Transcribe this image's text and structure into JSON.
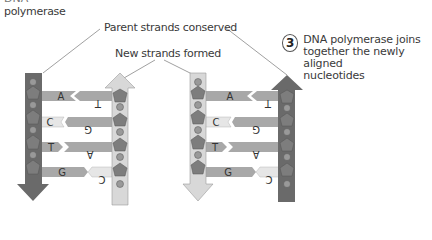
{
  "top_label": {
    "cut_line": "DNA",
    "text": "polymerase"
  },
  "labels": {
    "parent": "Parent strands conserved",
    "new": "New strands formed"
  },
  "step": {
    "number": "3",
    "line1": "DNA polymerase joins",
    "line2": "together the newly aligned",
    "line3": "nucleotides"
  },
  "colors": {
    "parent_strand": "#6a6a6a",
    "new_strand": "#d6d6d6",
    "base_bar": "#a8a8a8",
    "base_light": "#e6e6e6",
    "sugar": "#7a7a7a",
    "phosphate": "#9a9a9a"
  },
  "left_helix": {
    "parent_bases": [
      "A",
      "C",
      "T",
      "G"
    ],
    "new_bases": [
      "T",
      "G",
      "A",
      "C"
    ]
  },
  "right_helix": {
    "new_bases": [
      "A",
      "C",
      "T",
      "G"
    ],
    "parent_bases": [
      "T",
      "G",
      "A",
      "C"
    ]
  }
}
